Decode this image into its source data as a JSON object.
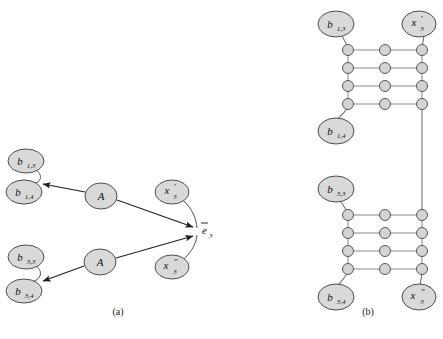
{
  "figure": {
    "panels": [
      {
        "id": "a",
        "caption": "(a)",
        "caption_x": 118,
        "caption_y": 306
      },
      {
        "id": "b",
        "caption": "(b)",
        "caption_x": 368,
        "caption_y": 306
      }
    ]
  },
  "style": {
    "node_fill": "#d9d9d9",
    "node_stroke": "#4d4d4d",
    "small_node_fill": "#d4d4d4",
    "small_node_stroke": "#595959",
    "edge_color": "#2b2b2b",
    "ladder_color": "#7a7a7a",
    "text_color": "#111111",
    "background": "#ffffff"
  },
  "panel_a": {
    "nodes": [
      {
        "name": "b13",
        "label": "b",
        "sub": "1,3",
        "prime": "",
        "cx": 26,
        "cy": 161,
        "rx": 18,
        "ry": 12
      },
      {
        "name": "b14",
        "label": "b",
        "sub": "1,4",
        "prime": "",
        "cx": 24,
        "cy": 192,
        "rx": 18,
        "ry": 12
      },
      {
        "name": "b33",
        "label": "b",
        "sub": "3,3",
        "prime": "",
        "cx": 26,
        "cy": 257,
        "rx": 18,
        "ry": 12
      },
      {
        "name": "b34",
        "label": "b",
        "sub": "3,4",
        "prime": "",
        "cx": 24,
        "cy": 291,
        "rx": 18,
        "ry": 12
      },
      {
        "name": "A-upper",
        "label": "A",
        "sub": "",
        "prime": "",
        "cx": 101,
        "cy": 196,
        "rx": 16,
        "ry": 13
      },
      {
        "name": "A-lower",
        "label": "A",
        "sub": "",
        "prime": "",
        "cx": 100,
        "cy": 262,
        "rx": 16,
        "ry": 13
      },
      {
        "name": "x3prime",
        "label": "x",
        "sub": "3",
        "prime": "′",
        "cx": 172,
        "cy": 192,
        "rx": 17,
        "ry": 12
      },
      {
        "name": "x3dprime",
        "label": "x",
        "sub": "3",
        "prime": "″",
        "cx": 172,
        "cy": 267,
        "rx": 17,
        "ry": 12
      }
    ],
    "sink": {
      "name": "e3-bar",
      "label": "e",
      "sub": "3",
      "bar": true,
      "x": 202,
      "y": 231
    },
    "arrows": [
      {
        "name": "arrow-A-upper-to-b14",
        "from": "A-upper",
        "to": "b14"
      },
      {
        "name": "arrow-A-upper-to-e3",
        "from": "A-upper",
        "to": "e3"
      },
      {
        "name": "arrow-A-lower-to-b34",
        "from": "A-lower",
        "to": "b34"
      },
      {
        "name": "arrow-A-lower-to-e3",
        "from": "A-lower",
        "to": "e3"
      }
    ],
    "braces": [
      {
        "name": "brace-b13-b14",
        "pairs": "b13,b14"
      },
      {
        "name": "brace-b33-b34",
        "pairs": "b33,b34"
      },
      {
        "name": "brace-x3prime-e3",
        "pairs": "x3prime,e3"
      },
      {
        "name": "brace-x3dprime-e3",
        "pairs": "x3dprime,e3"
      }
    ]
  },
  "panel_b": {
    "nodes": [
      {
        "name": "b13",
        "label": "b",
        "sub": "1,3",
        "prime": "",
        "cx": 336,
        "cy": 24,
        "rx": 18,
        "ry": 13
      },
      {
        "name": "x3prime",
        "label": "x",
        "sub": "3",
        "prime": "′",
        "cx": 419,
        "cy": 24,
        "rx": 17,
        "ry": 13
      },
      {
        "name": "b14",
        "label": "b",
        "sub": "1,4",
        "prime": "",
        "cx": 336,
        "cy": 131,
        "rx": 18,
        "ry": 13
      },
      {
        "name": "b33",
        "label": "b",
        "sub": "3,3",
        "prime": "",
        "cx": 336,
        "cy": 189,
        "rx": 18,
        "ry": 13
      },
      {
        "name": "b34",
        "label": "b",
        "sub": "3,4",
        "prime": "",
        "cx": 336,
        "cy": 297,
        "rx": 18,
        "ry": 13
      },
      {
        "name": "x3dprime",
        "label": "x",
        "sub": "3",
        "prime": "″",
        "cx": 419,
        "cy": 297,
        "rx": 17,
        "ry": 13
      }
    ],
    "ladder_top": {
      "name": "ladder-top",
      "columns": [
        348,
        385,
        422
      ],
      "rows": [
        50,
        68,
        86,
        104
      ],
      "node_radius": 5.5
    },
    "ladder_bottom": {
      "name": "ladder-bottom",
      "columns": [
        348,
        385,
        422
      ],
      "rows": [
        215,
        233,
        251,
        269
      ],
      "node_radius": 5.5
    },
    "connectors": [
      {
        "name": "connector-b13-to-ladder-top",
        "from_node": "b13",
        "to_point": [
          348,
          50
        ]
      },
      {
        "name": "connector-x3prime-to-ladder-top",
        "from_node": "x3prime",
        "to_point": [
          422,
          50
        ]
      },
      {
        "name": "connector-ladder-top-to-b14",
        "from_point": [
          348,
          104
        ],
        "to_node": "b14"
      },
      {
        "name": "connector-top-to-bottom-right",
        "from_point": [
          422,
          104
        ],
        "to_point": [
          422,
          215
        ]
      },
      {
        "name": "connector-b33-to-ladder-bottom",
        "from_node": "b33",
        "to_point": [
          348,
          215
        ]
      },
      {
        "name": "connector-ladder-bottom-to-b34",
        "from_point": [
          348,
          269
        ],
        "to_node": "b34"
      },
      {
        "name": "connector-ladder-bottom-to-x3dprime",
        "from_point": [
          422,
          269
        ],
        "to_node": "x3dprime"
      }
    ]
  }
}
